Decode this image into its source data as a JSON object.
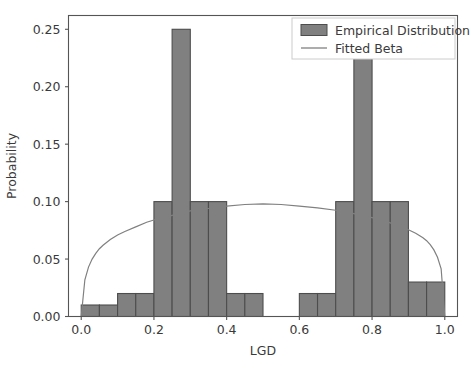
{
  "chart_data": {
    "type": "bar",
    "title": "",
    "xlabel": "LGD",
    "ylabel": "Probability",
    "xlim": [
      -0.035,
      1.035
    ],
    "ylim": [
      0.0,
      0.262
    ],
    "grid": false,
    "xticks": [
      0.0,
      0.2,
      0.4,
      0.6,
      0.8,
      1.0
    ],
    "xtick_labels": [
      "0.0",
      "0.2",
      "0.4",
      "0.6",
      "0.8",
      "1.0"
    ],
    "yticks": [
      0.0,
      0.05,
      0.1,
      0.15,
      0.2,
      0.25
    ],
    "ytick_labels": [
      "0.00",
      "0.05",
      "0.10",
      "0.15",
      "0.20",
      "0.25"
    ],
    "legend_position": "upper right",
    "series": [
      {
        "name": "Empirical Distribution",
        "type": "histogram",
        "color": "#808080",
        "edge_color": "#4d4d4d",
        "bin_edges": [
          0.0,
          0.05,
          0.1,
          0.15,
          0.2,
          0.25,
          0.3,
          0.35,
          0.4,
          0.45,
          0.5,
          0.55,
          0.6,
          0.65,
          0.7,
          0.75,
          0.8,
          0.85,
          0.9,
          0.95,
          1.0
        ],
        "values": [
          0.01,
          0.01,
          0.02,
          0.02,
          0.1,
          0.25,
          0.1,
          0.1,
          0.02,
          0.02,
          0.0,
          0.0,
          0.02,
          0.02,
          0.1,
          0.225,
          0.1,
          0.1,
          0.03,
          0.03
        ]
      },
      {
        "name": "Fitted Beta",
        "type": "line",
        "color": "#808080",
        "x": [
          0.0,
          0.01,
          0.02,
          0.03,
          0.04,
          0.05,
          0.06,
          0.08,
          0.1,
          0.12,
          0.15,
          0.18,
          0.2,
          0.25,
          0.3,
          0.35,
          0.4,
          0.45,
          0.5,
          0.55,
          0.6,
          0.65,
          0.7,
          0.75,
          0.8,
          0.82,
          0.85,
          0.88,
          0.9,
          0.92,
          0.94,
          0.95,
          0.96,
          0.97,
          0.98,
          0.99,
          1.0
        ],
        "y": [
          0.0,
          0.032,
          0.043,
          0.05,
          0.055,
          0.059,
          0.062,
          0.067,
          0.071,
          0.074,
          0.078,
          0.082,
          0.084,
          0.088,
          0.092,
          0.094,
          0.096,
          0.0975,
          0.098,
          0.0975,
          0.096,
          0.0945,
          0.0925,
          0.0895,
          0.086,
          0.0845,
          0.0815,
          0.078,
          0.0755,
          0.0725,
          0.0685,
          0.066,
          0.0625,
          0.058,
          0.0515,
          0.0415,
          0.0
        ]
      }
    ]
  },
  "legend": {
    "entries": [
      {
        "label": "Empirical Distribution",
        "marker": "patch"
      },
      {
        "label": "Fitted Beta",
        "marker": "line"
      }
    ]
  },
  "colors": {
    "bar_fill": "#808080",
    "bar_edge": "#4d4d4d",
    "curve": "#808080",
    "axis": "#555555",
    "text": "#3a3a3a",
    "background": "#ffffff"
  }
}
